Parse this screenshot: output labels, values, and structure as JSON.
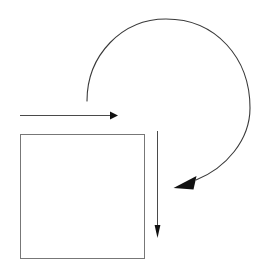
{
  "figure": {
    "width": 266,
    "height": 273,
    "background_color": "#ffffff",
    "stroke_color": "#3a3a3a",
    "arrowhead_color": "#111111"
  },
  "shapes": {
    "square": {
      "name": "open square outline",
      "x": 20,
      "y": 134,
      "width": 124,
      "height": 124,
      "fill": "none",
      "stroke_color": "#777777",
      "stroke_width": 1
    },
    "horizontal_arrow": {
      "name": "horizontal arrow pointing right",
      "x1": 20,
      "y1": 115,
      "x2": 118,
      "y2": 115,
      "direction": "right",
      "stroke_color": "#4a4a4a",
      "stroke_width": 1
    },
    "vertical_arrow": {
      "name": "vertical arrow pointing down",
      "x1": 157,
      "y1": 131,
      "x2": 157,
      "y2": 236,
      "direction": "down",
      "stroke_color": "#4a4a4a",
      "stroke_width": 1
    },
    "curved_arrow": {
      "name": "clockwise curved arrow",
      "start_x": 87,
      "start_y": 101,
      "end_x": 176,
      "end_y": 186,
      "top_x": 170,
      "top_y": 19,
      "right_x": 250,
      "right_y": 108,
      "direction": "clockwise",
      "stroke_color": "#3a3a3a",
      "stroke_width": 1.1
    }
  },
  "chart_data": {
    "type": "diagram",
    "title": "",
    "elements": [
      {
        "id": "square",
        "kind": "rectangle",
        "x": 20,
        "y": 134,
        "w": 124,
        "h": 124
      },
      {
        "id": "arrow-right",
        "kind": "arrow",
        "from": [
          20,
          115
        ],
        "to": [
          118,
          115
        ]
      },
      {
        "id": "arrow-down",
        "kind": "arrow",
        "from": [
          157,
          131
        ],
        "to": [
          157,
          236
        ]
      },
      {
        "id": "arrow-curved",
        "kind": "curved-arrow",
        "from": [
          87,
          101
        ],
        "to": [
          176,
          186
        ]
      }
    ]
  }
}
